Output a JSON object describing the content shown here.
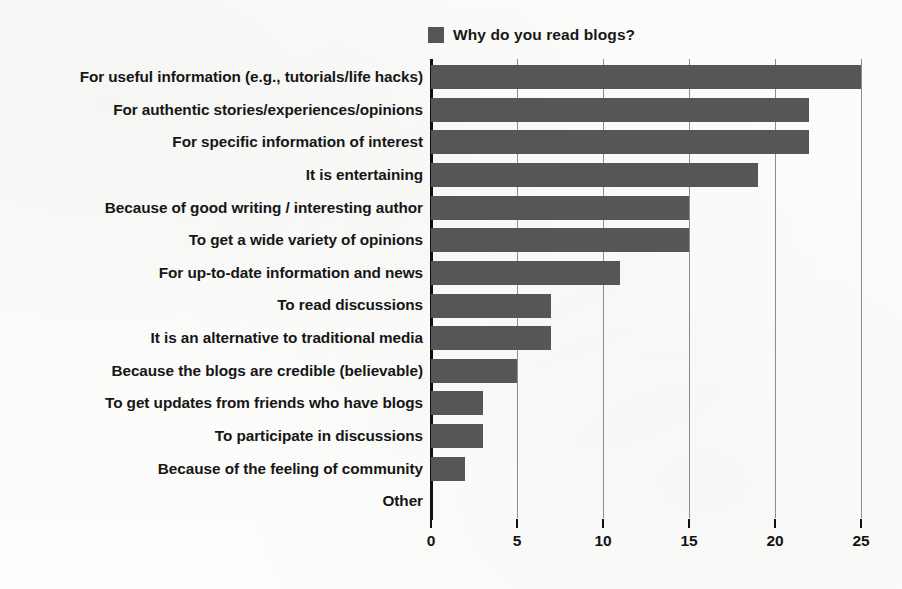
{
  "legend": {
    "marker_icon": "legend-square-icon",
    "label": "Why do you read blogs?",
    "color": "#565656"
  },
  "chart_data": {
    "type": "bar",
    "orientation": "horizontal",
    "title": "Why do you read blogs?",
    "xlabel": "",
    "ylabel": "",
    "xlim": [
      0,
      25
    ],
    "xticks": [
      0,
      5,
      10,
      15,
      20,
      25
    ],
    "grid": true,
    "grid_axis": "x",
    "legend_position": "top",
    "series_name": "Why do you read blogs?",
    "series_color": "#565656",
    "categories": [
      "For useful information (e.g., tutorials/life hacks)",
      "For authentic stories/experiences/opinions",
      "For specific information of interest",
      "It is entertaining",
      "Because of good writing / interesting author",
      "To get a wide variety of opinions",
      "For up-to-date information and news",
      "To read discussions",
      "It is an alternative to traditional media",
      "Because the blogs are credible (believable)",
      "To get updates from friends who have blogs",
      "To participate in discussions",
      "Because of the feeling of community",
      "Other"
    ],
    "values": [
      25,
      22,
      22,
      19,
      15,
      15,
      11,
      7,
      7,
      5,
      3,
      3,
      2,
      0
    ]
  }
}
